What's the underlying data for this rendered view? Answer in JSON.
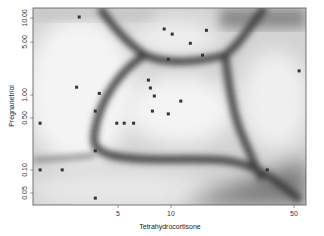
{
  "chart_data": {
    "type": "scatter",
    "title": "",
    "xlabel": "Tetrahydrocortisone",
    "ylabel": "Pregnanetriol",
    "xscale": "log",
    "yscale": "log",
    "xlim": [
      1.64,
      58
    ],
    "ylim": [
      0.034,
      14.5
    ],
    "x_ticks": [
      5,
      10,
      50
    ],
    "x_tick_labels": [
      "5",
      "10",
      "50"
    ],
    "y_ticks": [
      0.05,
      0.1,
      0.5,
      1,
      5,
      10
    ],
    "y_tick_labels": [
      "0.05",
      "0.10",
      "0.50",
      "1.00",
      "5.00",
      "10.00"
    ],
    "background": "grayscale classification-boundary density image (dark bands mark decision boundaries)",
    "grid": false,
    "legend": null,
    "points": [
      {
        "x": 3.0,
        "y": 11.0
      },
      {
        "x": 9.1,
        "y": 7.6
      },
      {
        "x": 10.1,
        "y": 6.5
      },
      {
        "x": 12.8,
        "y": 4.9
      },
      {
        "x": 15.8,
        "y": 7.3
      },
      {
        "x": 9.6,
        "y": 3.0
      },
      {
        "x": 15.0,
        "y": 3.4
      },
      {
        "x": 2.9,
        "y": 1.27
      },
      {
        "x": 3.9,
        "y": 1.05
      },
      {
        "x": 7.4,
        "y": 1.58
      },
      {
        "x": 7.6,
        "y": 1.24
      },
      {
        "x": 8.0,
        "y": 0.97
      },
      {
        "x": 11.3,
        "y": 0.83
      },
      {
        "x": 7.8,
        "y": 0.61
      },
      {
        "x": 1.8,
        "y": 0.42
      },
      {
        "x": 4.9,
        "y": 0.42
      },
      {
        "x": 5.4,
        "y": 0.42
      },
      {
        "x": 6.1,
        "y": 0.42
      },
      {
        "x": 3.7,
        "y": 0.61
      },
      {
        "x": 3.7,
        "y": 0.18
      },
      {
        "x": 9.6,
        "y": 0.56
      },
      {
        "x": 1.8,
        "y": 0.1
      },
      {
        "x": 2.4,
        "y": 0.1
      },
      {
        "x": 3.7,
        "y": 0.042
      },
      {
        "x": 35.0,
        "y": 0.1
      },
      {
        "x": 53.0,
        "y": 2.1
      }
    ]
  },
  "axes": {
    "xlabel": "Tetrahydrocortisone",
    "ylabel": "Pregnanetriol",
    "x_tick_labels": [
      "5",
      "10",
      "50"
    ],
    "y_tick_labels": [
      "0.05",
      "0.10",
      "0.50",
      "1.00",
      "5.00",
      "10.00"
    ]
  }
}
